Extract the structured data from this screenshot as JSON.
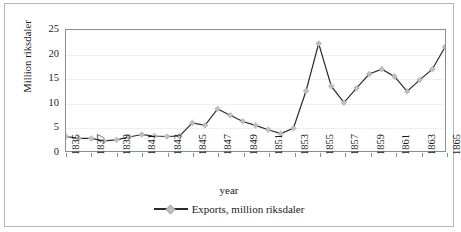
{
  "chart_data": {
    "type": "line",
    "title": "",
    "xlabel": "year",
    "ylabel": "Million riksdaler",
    "ylim": [
      0,
      25
    ],
    "yticks": [
      0,
      5,
      10,
      15,
      20,
      25
    ],
    "xticks": [
      "1835",
      "1837",
      "1839",
      "1841",
      "1843",
      "1845",
      "1847",
      "1849",
      "1851",
      "1853",
      "1855",
      "1857",
      "1859",
      "1861",
      "1863",
      "1865"
    ],
    "xlim": [
      1835,
      1865
    ],
    "grid": "horizontal",
    "legend_position": "bottom",
    "series": [
      {
        "name": "Exports, million riksdaler",
        "marker": "diamond",
        "marker_color": "#bfbfbf",
        "line_color": "#2b2b2b",
        "x": [
          1835,
          1836,
          1837,
          1838,
          1839,
          1840,
          1841,
          1842,
          1843,
          1844,
          1845,
          1846,
          1847,
          1848,
          1849,
          1850,
          1851,
          1852,
          1853,
          1854,
          1855,
          1856,
          1857,
          1858,
          1859,
          1860,
          1861,
          1862,
          1863,
          1864,
          1865
        ],
        "values": [
          3.0,
          2.6,
          2.6,
          2.1,
          2.3,
          2.9,
          3.4,
          3.1,
          3.0,
          3.1,
          5.8,
          5.3,
          8.7,
          7.4,
          6.1,
          5.3,
          4.4,
          3.6,
          4.7,
          12.4,
          22.2,
          13.4,
          10.0,
          13.0,
          15.9,
          16.9,
          15.4,
          12.3,
          14.7,
          16.9,
          21.5
        ]
      }
    ]
  },
  "legend": {
    "entries": [
      {
        "label": "Exports, million riksdaler"
      }
    ]
  }
}
